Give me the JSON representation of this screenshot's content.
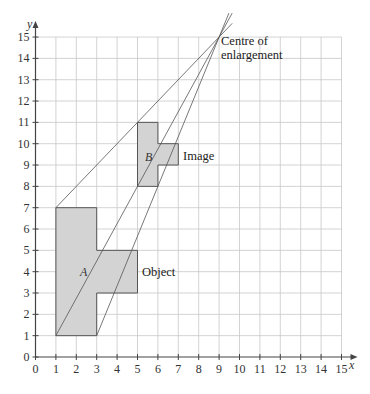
{
  "diagram": {
    "type": "coordinate-grid enlargement",
    "axes": {
      "x_label": "x",
      "y_label": "y",
      "x_range": [
        0,
        15
      ],
      "y_range": [
        0,
        15
      ],
      "x_ticks": [
        "0",
        "1",
        "2",
        "3",
        "4",
        "5",
        "6",
        "7",
        "8",
        "9",
        "10",
        "11",
        "12",
        "13",
        "14",
        "15"
      ],
      "y_ticks": [
        "0",
        "1",
        "2",
        "3",
        "4",
        "5",
        "6",
        "7",
        "8",
        "9",
        "10",
        "11",
        "12",
        "13",
        "14",
        "15"
      ],
      "grid": true
    },
    "shapes": {
      "object": {
        "letter": "A",
        "label": "Object",
        "vertices": [
          [
            1,
            1
          ],
          [
            3,
            1
          ],
          [
            3,
            3
          ],
          [
            5,
            3
          ],
          [
            5,
            5
          ],
          [
            3,
            5
          ],
          [
            3,
            7
          ],
          [
            1,
            7
          ]
        ]
      },
      "image": {
        "letter": "B",
        "label": "Image",
        "vertices": [
          [
            5,
            8
          ],
          [
            6,
            8
          ],
          [
            6,
            9
          ],
          [
            7,
            9
          ],
          [
            7,
            10
          ],
          [
            6,
            10
          ],
          [
            6,
            11
          ],
          [
            5,
            11
          ]
        ]
      }
    },
    "centre": {
      "point": [
        9,
        15
      ],
      "label_line1": "Centre of",
      "label_line2": "enlargement"
    },
    "rays": [
      {
        "from": [
          1,
          7
        ],
        "to": [
          9,
          15
        ]
      },
      {
        "from": [
          1,
          1
        ],
        "to": [
          9,
          15
        ]
      },
      {
        "from": [
          3,
          1
        ],
        "to": [
          9,
          15
        ]
      }
    ],
    "colors": {
      "grid": "#c8c8c8",
      "axis": "#444444",
      "shape_fill": "#d3d3d3",
      "shape_stroke": "#555555",
      "ray": "#555555"
    }
  }
}
